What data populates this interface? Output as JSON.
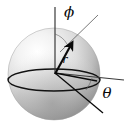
{
  "figure": {
    "background_color": "#ffffff",
    "labels": {
      "phi": "ϕ",
      "theta": "θ",
      "radius": "r"
    },
    "sphere": {
      "center_x": 54,
      "center_y": 74,
      "radius_x": 46,
      "radius_y": 46,
      "fill_light": "#ffffff",
      "fill_mid": "#d8d8d8",
      "fill_dark": "#8f8f8f",
      "highlight_x": 30,
      "highlight_y": 48
    },
    "equator": {
      "center_x": 54,
      "center_y": 80,
      "radius_x": 46,
      "radius_y": 11,
      "stroke": "#121212",
      "stroke_width": 1.4
    },
    "origin": {
      "x": 55,
      "y": 73
    },
    "polar_axis": {
      "name": "vertical-axis",
      "x1": 55,
      "y1": 7,
      "x2": 55,
      "y2": 74,
      "stroke": "#3a3a3a",
      "stroke_width": 1.2
    },
    "azimuth_axis": {
      "name": "horizontal-axis",
      "x1": 55,
      "y1": 73,
      "x2": 124,
      "y2": 80,
      "stroke": "#3a3a3a",
      "stroke_width": 1.1
    },
    "radius_vector": {
      "name": "r-vector",
      "x1": 55,
      "y1": 74,
      "x2": 72,
      "y2": 42,
      "stroke": "#0a0a0a",
      "stroke_width": 2.1
    },
    "phi_ray": {
      "name": "phi-reference-ray",
      "x1": 60,
      "y1": 52,
      "x2": 98,
      "y2": 15,
      "stroke": "#6a6a6a",
      "stroke_width": 0.9
    },
    "theta_ray": {
      "name": "theta-reference-ray",
      "x1": 55,
      "y1": 73,
      "x2": 103,
      "y2": 113,
      "stroke": "#0a0a0a",
      "stroke_width": 1.3
    },
    "projection_segment": {
      "name": "projection-segment",
      "x1": 55,
      "y1": 73,
      "x2": 97,
      "y2": 81,
      "stroke": "#0a0a0a",
      "stroke_width": 1.3
    },
    "phi_arc": {
      "name": "phi-angle-arc",
      "path": "M 55 34 A 22 22 0 0 1 67 44",
      "stroke": "#5a5a5a"
    },
    "theta_arc": {
      "name": "theta-angle-arc",
      "path": "M 92 78 A 40 40 0 0 1 86 90",
      "stroke": "#5a5a5a"
    },
    "label_positions": {
      "phi": {
        "x": 69,
        "y": 17,
        "font_size": 15
      },
      "theta": {
        "x": 107,
        "y": 98,
        "font_size": 15
      },
      "radius": {
        "x": 65,
        "y": 62,
        "font_size": 11
      }
    }
  }
}
